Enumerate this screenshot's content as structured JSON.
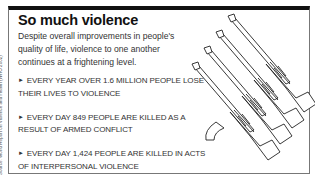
{
  "infobox": {
    "title": "So much violence",
    "intro": "Despite overall improvements in people's quality of life, violence to one another continues at a frightening level.",
    "facts": [
      "Every year over 1.6 million people lose their lives to violence",
      "Every day 849 people are killed as a result of armed conflict",
      "Every day 1,424 people are killed in acts of interpersonal violence"
    ],
    "bullet": "►",
    "source": "Source: World Report on Violence and Health (WHO 2002)",
    "illustration": "four-rifles-icon"
  }
}
